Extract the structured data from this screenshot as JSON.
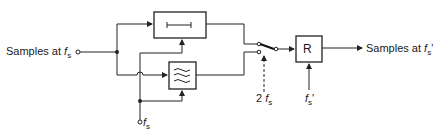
{
  "diagram": {
    "input_label": "Samples at",
    "input_symbol": "f",
    "input_sub": "s",
    "output_label": "Samples at",
    "output_symbol": "f",
    "output_sub": "s",
    "output_prime": "'",
    "clock_label_symbol": "f",
    "clock_label_sub": "s",
    "switch_label_prefix": "2",
    "switch_label_symbol": "f",
    "switch_label_sub": "s",
    "resampler_label": "R",
    "resampler_clock_symbol": "f",
    "resampler_clock_sub": "s",
    "resampler_clock_prime": "'",
    "blocks": [
      {
        "id": "hold",
        "glyph": "hold-bar"
      },
      {
        "id": "lowpass",
        "glyph": "lowpass-filter"
      },
      {
        "id": "resampler",
        "glyph": "R"
      }
    ]
  }
}
